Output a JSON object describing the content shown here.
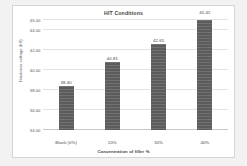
{
  "chart_data": {
    "type": "bar",
    "title": "HIT Conditions",
    "xlabel": "Concentration of filler %",
    "ylabel": "Hardness voltage (kV)",
    "categories": [
      "Blank (0%)",
      "20%",
      "30%",
      "40%"
    ],
    "values": [
      38.4,
      40.81,
      42.65,
      45.45
    ],
    "value_labels": [
      "38.40",
      "40.81",
      "42.65",
      "45.45"
    ],
    "ylim": [
      34.0,
      45.0
    ],
    "yticks": [
      34.0,
      36.0,
      38.0,
      40.0,
      42.0,
      44.0,
      45.0
    ],
    "ytick_labels": [
      "34.00",
      "36.00",
      "38.00",
      "40.00",
      "42.00",
      "44.00",
      "45.00"
    ],
    "grid": true,
    "legend": false,
    "series": [
      {
        "name": "Hardness voltage",
        "values": [
          38.4,
          40.81,
          42.65,
          45.45
        ]
      }
    ],
    "colors": {
      "bar": "#5c5c5c",
      "gridline": "#e3e3e3",
      "axis": "#c9c9c9",
      "plot_background": "#ffffff",
      "figure_background": "#f2f2f2",
      "text": "#3f3f3f"
    }
  }
}
